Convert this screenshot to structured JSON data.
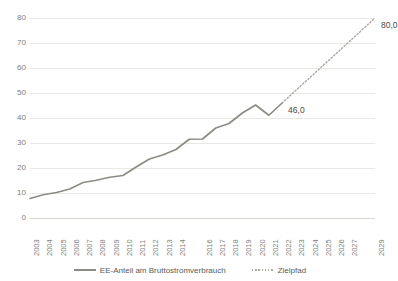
{
  "chart_data": {
    "type": "line",
    "title": "",
    "subtitle": "",
    "xlabel": "",
    "ylabel": "",
    "ylim": [
      0,
      80
    ],
    "ytick_values": [
      0,
      10,
      20,
      30,
      40,
      50,
      60,
      70,
      80
    ],
    "ytick_labels": [
      "0",
      "10",
      "20",
      "30",
      "40",
      "50",
      "60",
      "70",
      "80"
    ],
    "grid": true,
    "legend_position": "bottom",
    "x": [
      2003,
      2004,
      2005,
      2006,
      2007,
      2008,
      2009,
      2010,
      2011,
      2012,
      2013,
      2014,
      2015,
      2016,
      2017,
      2018,
      2019,
      2020,
      2021,
      2022,
      2023,
      2024,
      2025,
      2026,
      2027,
      2028,
      2029
    ],
    "xtick_labels": [
      "2003",
      "2004",
      "2005",
      "2006",
      "2007",
      "2008",
      "2009",
      "2010",
      "2011",
      "2012",
      "2013",
      "2014",
      "",
      "2016",
      "2017",
      "2018",
      "2019",
      "2020",
      "2021",
      "2022",
      "2023",
      "2024",
      "2025",
      "2026",
      "2027",
      "",
      "2029"
    ],
    "series": [
      {
        "name": "EE-Anteil am Bruttostromverbrauch",
        "style": "solid",
        "color": "#8c8c85",
        "values": [
          7.8,
          9.3,
          10.2,
          11.6,
          14.2,
          15.1,
          16.3,
          17.0,
          20.4,
          23.6,
          25.2,
          27.4,
          31.5,
          31.6,
          36.0,
          37.8,
          42.0,
          45.2,
          41.1,
          46.0,
          null,
          null,
          null,
          null,
          null,
          null,
          null
        ]
      },
      {
        "name": "Zielpfad",
        "style": "dotted",
        "color": "#a8a8a1",
        "values": [
          null,
          null,
          null,
          null,
          null,
          null,
          null,
          null,
          null,
          null,
          null,
          null,
          null,
          null,
          null,
          null,
          null,
          null,
          null,
          46.0,
          50.9,
          55.7,
          60.6,
          65.4,
          70.3,
          75.1,
          80.0
        ]
      }
    ],
    "point_labels": [
      {
        "text": "46,0",
        "x": 2022,
        "y": 46.0
      },
      {
        "text": "80,0",
        "x": 2029,
        "y": 80.0
      }
    ]
  },
  "legend": {
    "items": [
      {
        "label": "EE-Anteil am Bruttostromverbrauch",
        "style": "solid"
      },
      {
        "label": "Zielpfad",
        "style": "dotted"
      }
    ]
  },
  "colors": {
    "series_line": "#8c8c85",
    "target_line": "#a8a8a1",
    "gridline": "#e9e9e4",
    "tick_text": "#808079",
    "label_text": "#4a4a45",
    "background": "#ffffff"
  }
}
